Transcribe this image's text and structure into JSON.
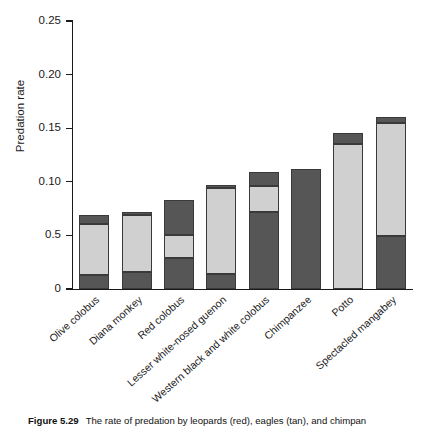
{
  "figure": {
    "caption_label": "Figure 5.29",
    "caption_text": "The rate of predation by leopards (red), eagles (tan), and chimpan"
  },
  "chart_data": {
    "type": "bar",
    "stacked": true,
    "title": "",
    "xlabel": "",
    "ylabel": "Predation rate",
    "ylim": [
      0,
      0.25
    ],
    "grid": false,
    "legend_position": "none",
    "ytick_labels": [
      "0.25",
      "0.20",
      "0.15",
      "0.10",
      "0.5",
      "0"
    ],
    "ytick_values": [
      0.25,
      0.2,
      0.15,
      0.1,
      0.05,
      0
    ],
    "categories": [
      "Olive colobus",
      "Diana monkey",
      "Red colobus",
      "Lesser white-nosed guenon",
      "Western black and white colobus",
      "Chimpanzee",
      "Potto",
      "Spectacled mangabey"
    ],
    "series": [
      {
        "name": "leopards",
        "color": "#565656",
        "values": [
          0.013,
          0.016,
          0.029,
          0.014,
          0.072,
          0.112,
          0.0,
          0.049
        ]
      },
      {
        "name": "eagles",
        "color": "#d0d0d0",
        "values": [
          0.048,
          0.053,
          0.021,
          0.08,
          0.024,
          0.0,
          0.135,
          0.106
        ]
      },
      {
        "name": "chimpanzees",
        "color": "#565656",
        "values": [
          0.008,
          0.003,
          0.033,
          0.003,
          0.013,
          0.0,
          0.011,
          0.005
        ]
      }
    ],
    "totals": [
      0.069,
      0.072,
      0.083,
      0.097,
      0.109,
      0.112,
      0.146,
      0.16
    ]
  }
}
